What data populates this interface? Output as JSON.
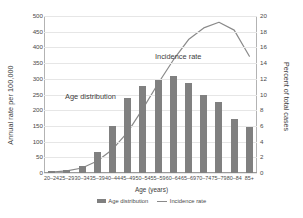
{
  "chart_data": {
    "type": "bar",
    "title": "",
    "subtitle": "",
    "xlabel": "Age (years)",
    "ylabel": "Annual rate per 100,000",
    "ylabel_right": "Percent of total cases",
    "categories": [
      "20–24",
      "25–29",
      "30–34",
      "35–39",
      "40–44",
      "45–49",
      "50–54",
      "55–59",
      "60–64",
      "65–69",
      "70–74",
      "75–79",
      "80–84",
      "85+"
    ],
    "ylim": [
      0,
      500
    ],
    "yticks": [
      0,
      50,
      100,
      150,
      200,
      250,
      300,
      350,
      400,
      450,
      500
    ],
    "ylim_right": [
      0,
      20
    ],
    "yticks_right": [
      0,
      2,
      4,
      6,
      8,
      10,
      12,
      14,
      16,
      18,
      20
    ],
    "grid": true,
    "legend_position": "bottom",
    "series": [
      {
        "name": "Age distribution",
        "type": "bar",
        "axis": "right",
        "unit": "percent of total cases",
        "color": "#808080",
        "values": [
          0.2,
          0.4,
          0.9,
          2.7,
          6.0,
          9.6,
          11.1,
          11.9,
          12.3,
          11.5,
          9.9,
          9.1,
          6.9,
          5.8
        ]
      },
      {
        "name": "Incidence rate",
        "type": "line",
        "axis": "left",
        "unit": "annual rate per 100,000",
        "color": "#8a8a8a",
        "values": [
          3,
          7,
          16,
          38,
          75,
          130,
          205,
          285,
          360,
          425,
          462,
          480,
          455,
          372
        ]
      }
    ],
    "annotations": [
      {
        "text": "Age distribution",
        "target": "bars"
      },
      {
        "text": "Incidence rate",
        "target": "line"
      }
    ]
  },
  "legend": {
    "items": [
      {
        "label": "Age distribution",
        "marker": "bar-swatch"
      },
      {
        "label": "Incidence rate",
        "marker": "line-swatch"
      }
    ]
  }
}
